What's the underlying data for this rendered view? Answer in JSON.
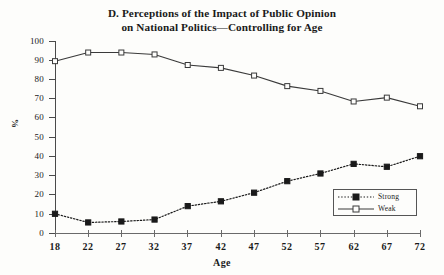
{
  "chart_data": {
    "type": "line",
    "title": "D. Perceptions of the Impact of Public Opinion on National Politics—Controlling for Age",
    "title_lines": [
      "D. Perceptions of the Impact of Public Opinion",
      "on National Politics—Controlling for Age"
    ],
    "xlabel": "Age",
    "ylabel": "%",
    "x": [
      18,
      22,
      27,
      32,
      37,
      42,
      47,
      52,
      57,
      62,
      67,
      72
    ],
    "xtick_labels": [
      "18",
      "22",
      "27",
      "32",
      "37",
      "42",
      "47",
      "52",
      "57",
      "62",
      "67",
      "72"
    ],
    "ytick_labels": [
      "0",
      "10",
      "20",
      "30",
      "40",
      "50",
      "60",
      "70",
      "80",
      "90",
      "100"
    ],
    "yticks": [
      0,
      10,
      20,
      30,
      40,
      50,
      60,
      70,
      80,
      90,
      100
    ],
    "ylim": [
      0,
      100
    ],
    "grid": false,
    "legend_position": "lower-right",
    "series": [
      {
        "name": "Strong",
        "values": [
          10,
          5.5,
          6,
          7,
          14,
          16.5,
          21,
          27,
          31,
          36,
          34.5,
          40
        ],
        "line_style": "dotted",
        "marker": "filled-square",
        "color": "#1a1a1a"
      },
      {
        "name": "Weak",
        "values": [
          89.5,
          94,
          94,
          93,
          87.5,
          86,
          82,
          76.5,
          74,
          68.5,
          70.5,
          66
        ],
        "line_style": "solid",
        "marker": "open-square",
        "color": "#3a3a3a"
      }
    ]
  },
  "legend": {
    "entries": [
      {
        "label": "Strong"
      },
      {
        "label": "Weak"
      }
    ]
  },
  "colors": {
    "background": "#fdfdfb",
    "ink": "#1a1a1a",
    "axis": "#4a4a4a"
  }
}
